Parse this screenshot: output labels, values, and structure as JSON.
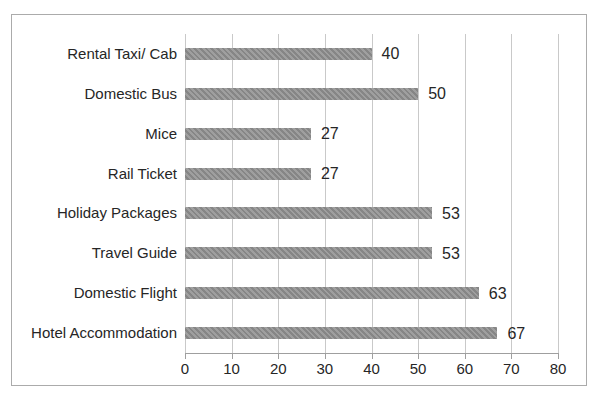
{
  "chart_data": {
    "type": "bar",
    "orientation": "horizontal",
    "title": "",
    "xlabel": "",
    "ylabel": "",
    "categories": [
      "Rental Taxi/ Cab",
      "Domestic Bus",
      "Mice",
      "Rail Ticket",
      "Holiday Packages",
      "Travel Guide",
      "Domestic Flight",
      "Hotel Accommodation"
    ],
    "values": [
      40,
      50,
      27,
      27,
      53,
      53,
      63,
      67
    ],
    "data_labels": [
      "40",
      "50",
      "27",
      "27",
      "53",
      "53",
      "63",
      "67"
    ],
    "xlim": [
      0,
      80
    ],
    "xticks": [
      0,
      10,
      20,
      30,
      40,
      50,
      60,
      70,
      80
    ],
    "xtick_labels": [
      "0",
      "10",
      "20",
      "30",
      "40",
      "50",
      "60",
      "70",
      "80"
    ],
    "grid": true,
    "legend": false,
    "colors": {
      "bar": "#8d8d8d",
      "gridline": "#c9c9c9",
      "axis_line": "#9f9f9f",
      "text": "#262626",
      "frame_border": "#ababab",
      "background": "#ffffff"
    }
  }
}
